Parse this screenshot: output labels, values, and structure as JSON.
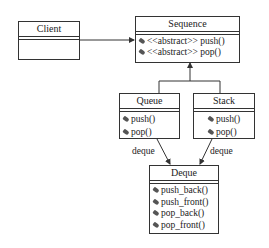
{
  "diagram": {
    "type": "uml-class-diagram",
    "classes": {
      "client": {
        "name": "Client",
        "operations": []
      },
      "sequence": {
        "name": "Sequence",
        "operations": [
          "<<abstract>> push()",
          "<<abstract>> pop()"
        ]
      },
      "queue": {
        "name": "Queue",
        "operations": [
          "push()",
          "pop()"
        ]
      },
      "stack": {
        "name": "Stack",
        "operations": [
          "push()",
          "pop()"
        ]
      },
      "deque": {
        "name": "Deque",
        "operations": [
          "push_back()",
          "push_front()",
          "pop_back()",
          "pop_front()"
        ]
      }
    },
    "relations": [
      {
        "from": "Client",
        "to": "Sequence",
        "kind": "association",
        "label": ""
      },
      {
        "from": "Queue",
        "to": "Sequence",
        "kind": "generalization",
        "label": ""
      },
      {
        "from": "Stack",
        "to": "Sequence",
        "kind": "generalization",
        "label": ""
      },
      {
        "from": "Queue",
        "to": "Deque",
        "kind": "association",
        "label": "deque"
      },
      {
        "from": "Stack",
        "to": "Deque",
        "kind": "association",
        "label": "deque"
      }
    ],
    "labels": {
      "queue_deque": "deque",
      "stack_deque": "deque"
    },
    "colors": {
      "line": "#333333",
      "background": "#ffffff"
    }
  }
}
